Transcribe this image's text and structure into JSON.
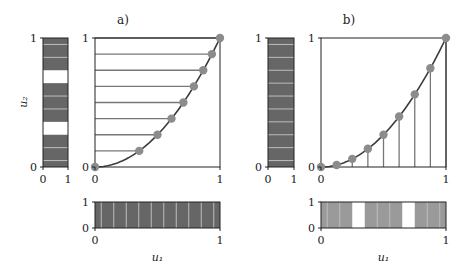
{
  "colors": {
    "strip_dark": "#666666",
    "strip_light": "#9a9a9a",
    "stripe_line": "#bdbdbd",
    "curve": "#3a3a3a",
    "sample_line": "#777777",
    "marker": "#8c8c8c",
    "axis": "#222222"
  },
  "chart_data": [
    {
      "panel": "a",
      "title": "a)",
      "type": "line",
      "description": "Curve u2 = u1^2 sampled uniformly in u2 (horizontal lines), with marginal density strips",
      "main": {
        "xlabel": "",
        "ylabel": "",
        "xlim": [
          0,
          1
        ],
        "ylim": [
          0,
          1
        ],
        "xticks": [
          "0",
          "1"
        ],
        "yticks": [
          "0",
          "1"
        ],
        "curve": "u2 = u1^2",
        "sample_lines": "horizontal",
        "sample_u2": [
          0,
          0.125,
          0.25,
          0.375,
          0.5,
          0.625,
          0.75,
          0.875,
          1
        ],
        "sample_u1": [
          0,
          0.354,
          0.5,
          0.612,
          0.707,
          0.791,
          0.866,
          0.935,
          1
        ]
      },
      "left_strip": {
        "ylabel": "u₂",
        "xticks": [
          "0",
          "1"
        ],
        "yticks": [
          "0",
          "1"
        ],
        "fill": "dark",
        "white_bands": [
          [
            0.25,
            0.35
          ],
          [
            0.65,
            0.75
          ]
        ],
        "stripe_lines": [
          0.05,
          0.15,
          0.45,
          0.55,
          0.85,
          0.95
        ]
      },
      "bottom_strip": {
        "xlabel": "u₁",
        "xticks": [
          "0",
          "1"
        ],
        "yticks": [
          "0",
          "1"
        ],
        "fill": "dark",
        "white_bands": [],
        "stripe_lines": [
          0.05,
          0.15,
          0.25,
          0.35,
          0.45,
          0.55,
          0.65,
          0.75,
          0.85,
          0.95
        ]
      }
    },
    {
      "panel": "b",
      "title": "b)",
      "type": "line",
      "description": "Curve u2 = u1^2 sampled uniformly in u1 (vertical lines), with marginal density strips",
      "main": {
        "xlabel": "",
        "ylabel": "",
        "xlim": [
          0,
          1
        ],
        "ylim": [
          0,
          1
        ],
        "xticks": [
          "0",
          "1"
        ],
        "yticks": [
          "0",
          "1"
        ],
        "curve": "u2 = u1^2",
        "sample_lines": "vertical",
        "sample_u1": [
          0,
          0.125,
          0.25,
          0.375,
          0.5,
          0.625,
          0.75,
          0.875,
          1
        ],
        "sample_u2": [
          0,
          0.016,
          0.063,
          0.141,
          0.25,
          0.391,
          0.563,
          0.766,
          1
        ]
      },
      "left_strip": {
        "ylabel": "",
        "xticks": [
          "0",
          "1"
        ],
        "yticks": [
          "0",
          "1"
        ],
        "fill": "dark",
        "white_bands": [],
        "stripe_lines": [
          0.05,
          0.15,
          0.25,
          0.35,
          0.45,
          0.55,
          0.65,
          0.75,
          0.85,
          0.95
        ]
      },
      "bottom_strip": {
        "xlabel": "u₁",
        "xticks": [
          "0",
          "1"
        ],
        "yticks": [
          "0",
          "1"
        ],
        "fill": "light",
        "white_bands": [
          [
            0.25,
            0.35
          ],
          [
            0.65,
            0.75
          ]
        ],
        "stripe_lines": [
          0.05,
          0.15,
          0.45,
          0.55,
          0.85,
          0.95
        ]
      }
    }
  ]
}
